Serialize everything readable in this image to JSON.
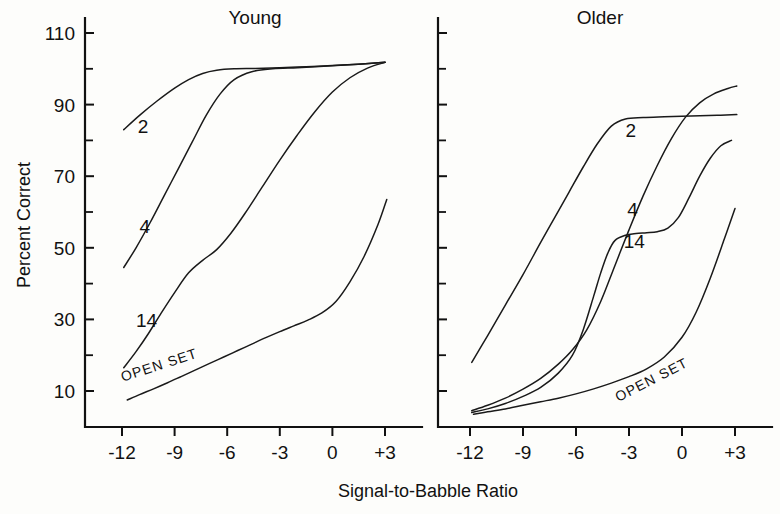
{
  "chart_data": {
    "type": "line",
    "title": "",
    "xlabel": "Signal-to-Babble Ratio",
    "ylabel": "Percent Correct",
    "xlim": [
      -13.5,
      4.5
    ],
    "ylim": [
      0,
      114
    ],
    "xticks": [
      -12,
      -9,
      -6,
      -3,
      0,
      3
    ],
    "xticklabels": [
      "-12",
      "-9",
      "-6",
      "-3",
      "0",
      "+3"
    ],
    "yticks": [
      10,
      30,
      50,
      70,
      90,
      110
    ],
    "yticklabels": [
      "10",
      "30",
      "50",
      "70",
      "90",
      "110"
    ],
    "yticks_minor": [
      20,
      40,
      60,
      80,
      100
    ],
    "grid": false,
    "legend": "inline curve labels",
    "panels": [
      {
        "name": "young",
        "title": "Young",
        "series": [
          {
            "name": "2",
            "label": "2",
            "label_x": -10.8,
            "label_y": 82,
            "x": [
              -11.9,
              -11.0,
              -10.0,
              -9.0,
              -8.2,
              -7.4,
              -6.6,
              -5.6,
              -4.4,
              -3.0,
              -1.5,
              0.0,
              1.5,
              3.0
            ],
            "y": [
              83.0,
              87.0,
              91.0,
              94.6,
              97.0,
              98.7,
              99.6,
              100.0,
              100.1,
              100.3,
              100.6,
              100.9,
              101.3,
              101.8
            ]
          },
          {
            "name": "4",
            "label": "4",
            "label_x": -10.7,
            "label_y": 54,
            "x": [
              -11.9,
              -11.2,
              -10.4,
              -9.6,
              -8.8,
              -8.0,
              -7.2,
              -6.4,
              -5.6,
              -4.6,
              -3.4,
              -2.0,
              -0.5,
              1.2,
              3.0
            ],
            "y": [
              44.5,
              50.0,
              57.0,
              64.5,
              72.0,
              79.5,
              87.0,
              93.0,
              97.0,
              99.2,
              100.0,
              100.3,
              100.7,
              101.2,
              101.8
            ]
          },
          {
            "name": "14",
            "label": "14",
            "label_x": -10.6,
            "label_y": 28,
            "x": [
              -11.9,
              -11.2,
              -10.5,
              -9.8,
              -9.0,
              -8.2,
              -7.4,
              -6.6,
              -5.8,
              -5.0,
              -4.0,
              -3.0,
              -2.0,
              -1.0,
              0.0,
              1.0,
              2.0,
              3.0
            ],
            "y": [
              16.5,
              21.0,
              26.0,
              31.5,
              37.5,
              43.0,
              46.5,
              49.5,
              54.0,
              59.5,
              67.0,
              74.5,
              81.5,
              88.0,
              93.5,
              97.5,
              100.2,
              101.8
            ]
          },
          {
            "name": "open-set",
            "label": "OPEN SET",
            "label_x": -9.8,
            "label_y": 16,
            "label_rotation": -18,
            "x": [
              -11.7,
              -11.0,
              -10.2,
              -9.4,
              -8.6,
              -7.8,
              -7.0,
              -6.2,
              -5.4,
              -4.6,
              -3.8,
              -3.0,
              -2.2,
              -1.4,
              -0.6,
              0.2,
              1.0,
              1.8,
              2.6,
              3.1
            ],
            "y": [
              7.5,
              9.0,
              10.6,
              12.3,
              14.1,
              15.9,
              17.7,
              19.5,
              21.3,
              23.1,
              24.9,
              26.6,
              28.2,
              29.8,
              31.8,
              35.0,
              40.5,
              47.5,
              56.5,
              63.5
            ]
          }
        ]
      },
      {
        "name": "older",
        "title": "Older",
        "series": [
          {
            "name": "2",
            "label": "2",
            "label_x": -2.9,
            "label_y": 81,
            "x": [
              -11.9,
              -11.0,
              -10.0,
              -9.0,
              -8.0,
              -7.2,
              -6.4,
              -5.6,
              -4.8,
              -4.0,
              -3.2,
              -2.2,
              -1.0,
              0.5,
              2.0,
              3.1
            ],
            "y": [
              18.0,
              25.5,
              34.0,
              42.5,
              51.5,
              58.5,
              65.5,
              72.5,
              79.0,
              84.0,
              86.0,
              86.4,
              86.6,
              86.8,
              87.0,
              87.2
            ]
          },
          {
            "name": "4",
            "label": "4",
            "label_x": -2.8,
            "label_y": 59,
            "x": [
              -11.9,
              -11.0,
              -10.0,
              -9.0,
              -8.0,
              -7.0,
              -6.2,
              -5.4,
              -4.6,
              -3.8,
              -3.0,
              -2.2,
              -1.4,
              -0.6,
              0.2,
              1.0,
              1.8,
              2.6,
              3.1
            ],
            "y": [
              4.5,
              6.0,
              8.0,
              10.5,
              13.5,
              17.5,
              21.5,
              27.0,
              35.0,
              45.0,
              55.0,
              64.5,
              73.0,
              80.5,
              86.5,
              90.5,
              93.0,
              94.5,
              95.2
            ]
          },
          {
            "name": "14",
            "label": "14",
            "label_x": -2.7,
            "label_y": 50,
            "x": [
              -11.9,
              -11.0,
              -10.0,
              -9.0,
              -8.0,
              -7.0,
              -6.2,
              -5.6,
              -5.0,
              -4.6,
              -4.2,
              -3.8,
              -3.2,
              -2.6,
              -2.0,
              -1.4,
              -0.8,
              -0.2,
              0.4,
              1.0,
              1.6,
              2.2,
              2.8
            ],
            "y": [
              4.0,
              5.0,
              6.5,
              8.5,
              11.0,
              15.0,
              20.0,
              27.0,
              36.5,
              43.0,
              48.5,
              52.0,
              53.5,
              54.0,
              54.2,
              54.5,
              55.5,
              58.5,
              64.0,
              70.0,
              75.0,
              78.5,
              80.0
            ]
          },
          {
            "name": "open-set",
            "label": "OPEN SET",
            "label_x": -1.6,
            "label_y": 12,
            "label_rotation": -27,
            "x": [
              -11.8,
              -11.0,
              -10.0,
              -9.0,
              -8.0,
              -7.0,
              -6.0,
              -5.0,
              -4.0,
              -3.0,
              -2.0,
              -1.0,
              0.0,
              0.8,
              1.6,
              2.4,
              3.0
            ],
            "y": [
              3.5,
              4.2,
              5.0,
              6.0,
              7.0,
              8.0,
              9.2,
              10.6,
              12.2,
              14.0,
              16.2,
              19.5,
              25.0,
              32.0,
              41.5,
              52.5,
              61.0
            ]
          }
        ]
      }
    ]
  }
}
